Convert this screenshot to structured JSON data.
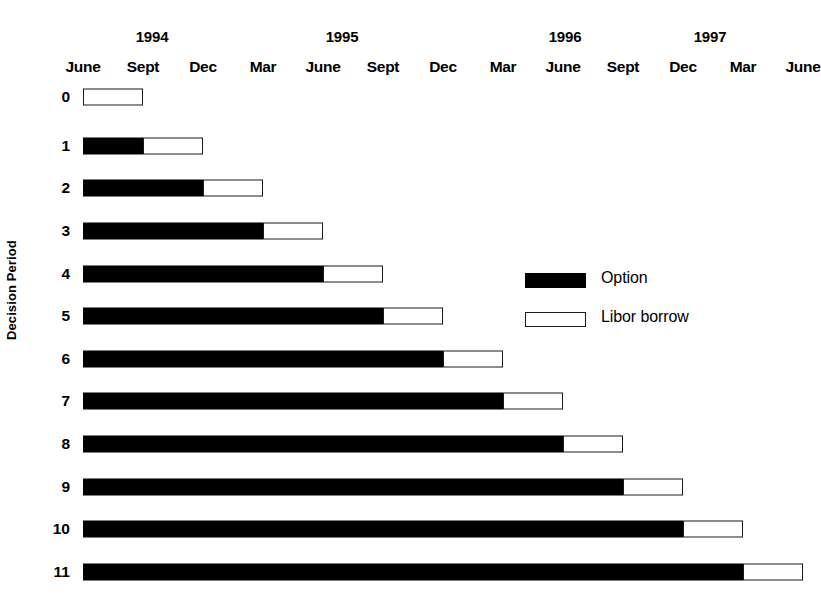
{
  "chart_data": {
    "type": "bar",
    "orientation": "horizontal",
    "title": "",
    "xlabel": "",
    "ylabel": "Decision Period",
    "stacked": true,
    "grid": false,
    "legend_position": "center-right",
    "x_axis": {
      "years": [
        {
          "label": "1994",
          "x": 152
        },
        {
          "label": "1995",
          "x": 342
        },
        {
          "label": "1996",
          "x": 565
        },
        {
          "label": "1997",
          "x": 710
        }
      ],
      "tick_labels": [
        "June",
        "Sept",
        "Dec",
        "Mar",
        "June",
        "Sept",
        "Dec",
        "Mar",
        "June",
        "Sept",
        "Dec",
        "Mar",
        "June"
      ],
      "tick_quarters": [
        "1994-06",
        "1994-09",
        "1994-12",
        "1995-03",
        "1995-06",
        "1995-09",
        "1995-12",
        "1996-03",
        "1996-06",
        "1996-09",
        "1996-12",
        "1997-03",
        "1997-06"
      ],
      "quarter_width_px": 60,
      "origin_px": 83
    },
    "categories": [
      "0",
      "1",
      "2",
      "3",
      "4",
      "5",
      "6",
      "7",
      "8",
      "9",
      "10",
      "11"
    ],
    "series": [
      {
        "name": "Option",
        "color": "#000000",
        "values": [
          0,
          1,
          2,
          3,
          4,
          5,
          6,
          7,
          8,
          9,
          10,
          11
        ]
      },
      {
        "name": "Libor borrow",
        "color": "#ffffff",
        "values": [
          1,
          1,
          1,
          1,
          1,
          1,
          1,
          1,
          1,
          1,
          1,
          1
        ]
      }
    ],
    "units": "quarters from June 1994",
    "rows": [
      {
        "label": "0",
        "option_quarters": 0,
        "libor_quarters": 1,
        "y": 97
      },
      {
        "label": "1",
        "option_quarters": 1,
        "libor_quarters": 1,
        "y": 146
      },
      {
        "label": "2",
        "option_quarters": 2,
        "libor_quarters": 1,
        "y": 188
      },
      {
        "label": "3",
        "option_quarters": 3,
        "libor_quarters": 1,
        "y": 231
      },
      {
        "label": "4",
        "option_quarters": 4,
        "libor_quarters": 1,
        "y": 274
      },
      {
        "label": "5",
        "option_quarters": 5,
        "libor_quarters": 1,
        "y": 316
      },
      {
        "label": "6",
        "option_quarters": 6,
        "libor_quarters": 1,
        "y": 359
      },
      {
        "label": "7",
        "option_quarters": 7,
        "libor_quarters": 1,
        "y": 401
      },
      {
        "label": "8",
        "option_quarters": 8,
        "libor_quarters": 1,
        "y": 444
      },
      {
        "label": "9",
        "option_quarters": 9,
        "libor_quarters": 1,
        "y": 487
      },
      {
        "label": "10",
        "option_quarters": 10,
        "libor_quarters": 1,
        "y": 529
      },
      {
        "label": "11",
        "option_quarters": 11,
        "libor_quarters": 1,
        "y": 572
      }
    ]
  },
  "axis": {
    "y_title": "Decision Period"
  },
  "legend": {
    "items": [
      {
        "label": "Option",
        "style": "filled",
        "y": 273
      },
      {
        "label": "Libor borrow",
        "style": "hollow",
        "y": 312
      }
    ],
    "x": 525
  }
}
